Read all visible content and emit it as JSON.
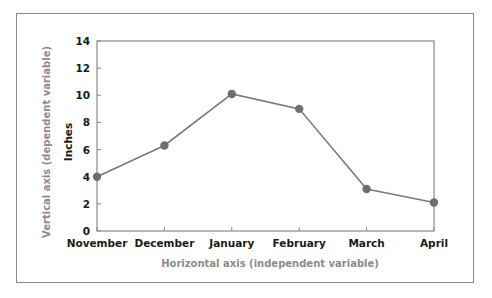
{
  "chart_data": {
    "type": "line",
    "title": "",
    "categories": [
      "November",
      "December",
      "January",
      "February",
      "March",
      "April"
    ],
    "series": [
      {
        "name": "Inches",
        "values": [
          4.0,
          6.3,
          10.1,
          9.0,
          3.1,
          2.1
        ]
      }
    ],
    "xlabel": "Horizontal axis (independent variable)",
    "ylabel": "Vertical axis (dependent variable)",
    "y_unit_label": "Inches",
    "ylim": [
      0,
      14
    ],
    "yticks": [
      0,
      2,
      4,
      6,
      8,
      10,
      12,
      14
    ],
    "grid": false,
    "legend": "none",
    "colors": {
      "line": "#7a7a7a",
      "marker": "#6e6e6e",
      "axis": "#8a8a8a",
      "axis_title": "#8c8c8c",
      "tick_text": "#1a1a1a"
    }
  }
}
